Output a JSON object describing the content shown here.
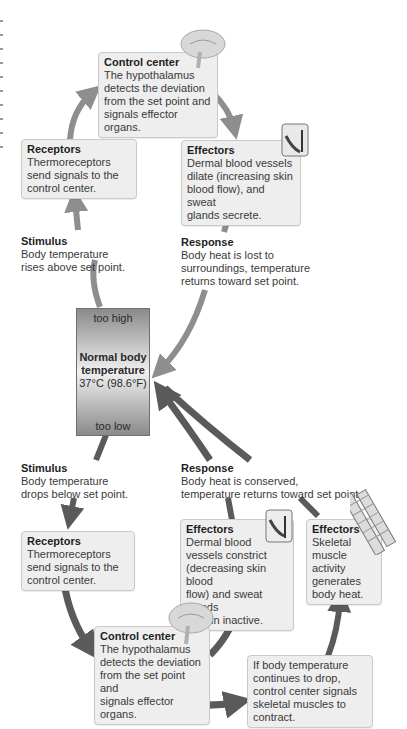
{
  "diagram": {
    "type": "negative-feedback-thermoregulation",
    "colors": {
      "upper_arrow": "#8e8e8e",
      "lower_arrow": "#5a5a5a",
      "box_fill": "#eeeeee",
      "box_border": "#c9c9c9"
    },
    "thermostat": {
      "too_high": "too high",
      "title_line1": "Normal body",
      "title_line2": "temperature",
      "value": "37°C (98.6°F)",
      "too_low": "too low"
    },
    "upper_loop": {
      "stimulus": {
        "title": "Stimulus",
        "text": "Body temperature\nrises above set point."
      },
      "receptors": {
        "title": "Receptors",
        "text": "Thermoreceptors\nsend signals to the\ncontrol center."
      },
      "control_center": {
        "title": "Control center",
        "text": "The hypothalamus\ndetects the deviation\nfrom the set point and\nsignals effector organs."
      },
      "effectors": {
        "title": "Effectors",
        "text": "Dermal blood vessels\ndilate (increasing skin\nblood flow), and sweat\nglands secrete."
      },
      "response": {
        "title": "Response",
        "text": "Body heat is lost to\nsurroundings, temperature\nreturns toward set point."
      }
    },
    "lower_loop": {
      "stimulus": {
        "title": "Stimulus",
        "text": "Body temperature\ndrops below set point."
      },
      "receptors": {
        "title": "Receptors",
        "text": "Thermoreceptors\nsend signals to the\ncontrol center."
      },
      "control_center": {
        "title": "Control center",
        "text": "The hypothalamus\ndetects the deviation\nfrom the set point and\nsignals effector organs."
      },
      "effectors_vessels": {
        "title": "Effectors",
        "text": "Dermal blood\nvessels constrict\n(decreasing skin blood\nflow) and sweat glands\nremain inactive."
      },
      "effectors_muscle": {
        "title": "Effectors",
        "text": "Skeletal\nmuscle\nactivity\ngenerates\nbody heat."
      },
      "shivering_note": {
        "text": "If body temperature\ncontinues to drop,\ncontrol center signals\nskeletal muscles to\ncontract."
      },
      "response": {
        "title": "Response",
        "text": "Body heat is conserved,\ntemperature returns toward set point."
      }
    },
    "icons": [
      "brain-icon",
      "skin-block-icon",
      "brain-icon",
      "skin-block-icon",
      "skeletal-muscle-icon"
    ]
  }
}
